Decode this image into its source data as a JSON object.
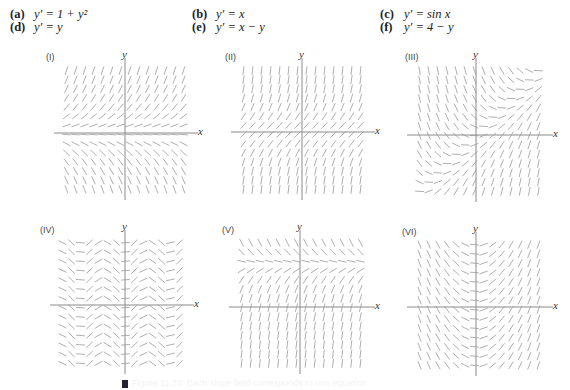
{
  "equations": [
    {
      "tag": "(a)",
      "expr": "y′ = 1 + y²",
      "col": 0,
      "row": 0
    },
    {
      "tag": "(b)",
      "expr": "y′ = x",
      "col": 1,
      "row": 0
    },
    {
      "tag": "(c)",
      "expr": "y′ = sin x",
      "col": 2,
      "row": 0
    },
    {
      "tag": "(d)",
      "expr": "y′ = y",
      "col": 0,
      "row": 1
    },
    {
      "tag": "(e)",
      "expr": "y′ = x − y",
      "col": 1,
      "row": 1
    },
    {
      "tag": "(f)",
      "expr": "y′ = 4 − y",
      "col": 2,
      "row": 1
    }
  ],
  "axes": {
    "x_label": "x",
    "y_label": "y"
  },
  "panels": [
    {
      "label": "(I)",
      "slope_fn": "y"
    },
    {
      "label": "(II)",
      "slope_fn": "1+y*y"
    },
    {
      "label": "(III)",
      "slope_fn": "x-y"
    },
    {
      "label": "(IV)",
      "slope_fn": "sin"
    },
    {
      "label": "(V)",
      "slope_fn": "4-y"
    },
    {
      "label": "(VI)",
      "slope_fn": "x"
    }
  ],
  "caption": {
    "text": "Figure 11.33: Each slope field corresponds to one equation"
  },
  "colors": {
    "segment": "#9a9a9a",
    "axis": "#8a8a8a",
    "text": "#222222"
  },
  "chart_data": {
    "type": "slope-field",
    "equations": [
      "y′ = 1 + y²",
      "y′ = x",
      "y′ = sin x",
      "y′ = y",
      "y′ = x − y",
      "y′ = 4 − y"
    ],
    "panels": [
      "(I)",
      "(II)",
      "(III)",
      "(IV)",
      "(V)",
      "(VI)"
    ],
    "grid": "14 × 14 short line segments per panel",
    "xlabel": "x",
    "ylabel": "y"
  }
}
